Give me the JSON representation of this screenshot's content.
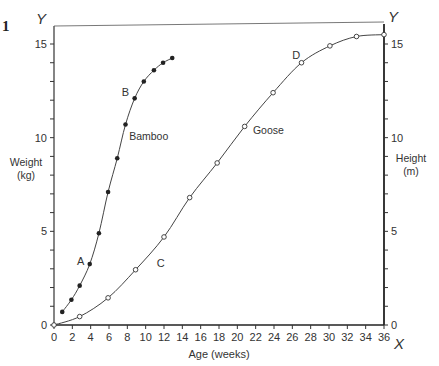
{
  "figure_number": "1",
  "chart_data": {
    "type": "line",
    "title": "",
    "xlabel": "Age (weeks)",
    "ylabel_left": "Weight\n(kg)",
    "ylabel_right": "Height\n(m)",
    "x_axis_letter": "X",
    "y_axis_letter_left": "Y",
    "y_axis_letter_right": "Y",
    "xlim": [
      0,
      36
    ],
    "ylim_left": [
      0,
      15
    ],
    "ylim_right": [
      0,
      15
    ],
    "x_ticks": [
      0,
      2,
      4,
      6,
      8,
      10,
      12,
      14,
      16,
      18,
      20,
      22,
      24,
      26,
      28,
      30,
      32,
      34,
      36
    ],
    "y_ticks_labeled": [
      0,
      5,
      10,
      15
    ],
    "y_minor_step": 1,
    "grid": false,
    "series": [
      {
        "name": "Bamboo",
        "axis": "left",
        "marker": "filled-circle",
        "x": [
          0.9,
          1.9,
          2.8,
          3.9,
          4.9,
          5.9,
          6.9,
          7.8,
          8.8,
          9.8,
          10.9,
          11.9,
          12.9
        ],
        "y": [
          0.7,
          1.35,
          2.1,
          3.25,
          4.9,
          7.1,
          8.9,
          10.7,
          12.1,
          13.0,
          13.6,
          14.0,
          14.25
        ]
      },
      {
        "name": "Goose",
        "axis": "right",
        "marker": "open-circle",
        "x": [
          0,
          2.8,
          5.9,
          8.9,
          12,
          14.8,
          17.8,
          20.8,
          23.9,
          27,
          30.1,
          33,
          36
        ],
        "y": [
          0,
          0.45,
          1.45,
          2.95,
          4.7,
          6.8,
          8.65,
          10.6,
          12.4,
          14.0,
          14.9,
          15.4,
          15.5
        ]
      }
    ],
    "annotations": [
      {
        "text": "A",
        "x": 2.5,
        "y": 3.2
      },
      {
        "text": "B",
        "x": 7.4,
        "y": 12.2
      },
      {
        "text": "C",
        "x": 11.2,
        "y": 3.1
      },
      {
        "text": "D",
        "x": 26,
        "y": 14.2
      },
      {
        "text": "Bamboo",
        "x": 8.2,
        "y": 9.9
      },
      {
        "text": "Goose",
        "x": 21.7,
        "y": 10.2
      }
    ]
  }
}
